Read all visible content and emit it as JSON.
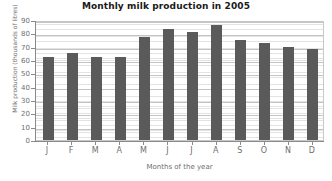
{
  "chart_data": {
    "type": "bar",
    "title": "Monthly milk production in 2005",
    "xlabel": "Months of the year",
    "ylabel": "Milk production (thousands of litres)",
    "categories": [
      "J",
      "F",
      "M",
      "A",
      "M",
      "J",
      "J",
      "A",
      "S",
      "O",
      "N",
      "D"
    ],
    "category_names": [
      "January",
      "February",
      "March",
      "April",
      "May",
      "June",
      "July",
      "August",
      "September",
      "October",
      "November",
      "December"
    ],
    "values": [
      62,
      65,
      62,
      62,
      77,
      83,
      81,
      86,
      75,
      73,
      70,
      68
    ],
    "ylim": [
      0,
      90
    ],
    "ytick_step": 10,
    "yticks": [
      0,
      10,
      20,
      30,
      40,
      50,
      60,
      70,
      80,
      90
    ],
    "ytick_labels": [
      "0",
      "10",
      "20",
      "30",
      "40",
      "50",
      "60",
      "70",
      "80",
      "90"
    ],
    "grid": true,
    "grid_axis": "y",
    "legend": false,
    "legend_position": "none",
    "bar_color": "#5a5a5a",
    "plot_background": "#ffffff",
    "grid_color": "#c8c8c8",
    "axis_color": "#8a8a8a",
    "title_color": "#1a1a1a",
    "label_color": "#6e6e6e"
  }
}
